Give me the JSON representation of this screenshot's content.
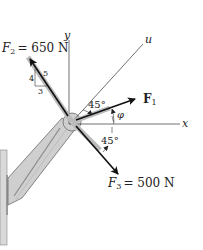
{
  "diagram": {
    "forces": {
      "F1": {
        "label": "F",
        "sub": "1"
      },
      "F2": {
        "label": "F",
        "sub": "2",
        "value": "= 650 N"
      },
      "F3": {
        "label": "F",
        "sub": "3",
        "value": "= 500 N"
      }
    },
    "axes": {
      "x": "x",
      "y": "y",
      "u": "u"
    },
    "angles": {
      "upper": "45°",
      "lower": "45°",
      "phi": "φ"
    },
    "slope_triangle": {
      "rise": "4",
      "run": "3",
      "hyp": "5"
    },
    "colors": {
      "line": "#222222",
      "bracket": "#cfcfcf",
      "bracket_edge": "#6a6a6a",
      "wall": "#d9d9d9"
    }
  }
}
